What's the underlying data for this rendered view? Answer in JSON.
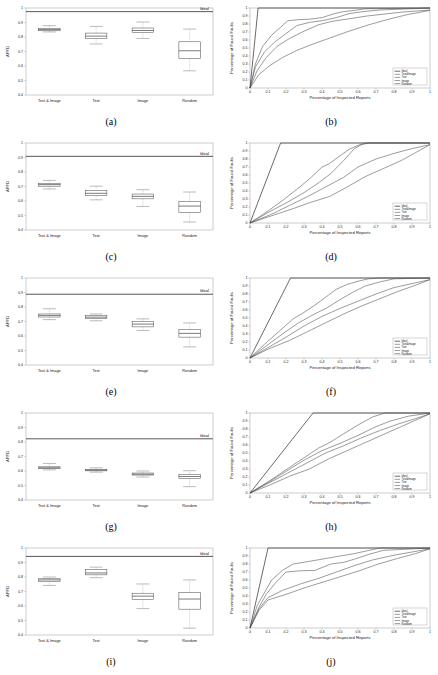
{
  "figure": {
    "panel_labels": [
      "(a)",
      "(b)",
      "(c)",
      "(d)",
      "(e)",
      "(f)",
      "(g)",
      "(h)",
      "(i)",
      "(j)"
    ]
  },
  "box_axis": {
    "ylabel": "APFD",
    "yticks": [
      "0.4",
      "0.5",
      "0.6",
      "0.7",
      "0.8",
      "0.9",
      "1"
    ],
    "categories": [
      "Text & Image",
      "Text",
      "Image",
      "Random"
    ],
    "ideal_label": "Ideal"
  },
  "curve_axis": {
    "xlabel": "Percentage of Inspected Reports",
    "ylabel": "Percentage of Found Faults",
    "xticks": [
      "0",
      "0.1",
      "0.2",
      "0.3",
      "0.4",
      "0.5",
      "0.6",
      "0.7",
      "0.8",
      "0.9",
      "1"
    ],
    "yticks": [
      "0",
      "0.1",
      "0.2",
      "0.3",
      "0.4",
      "0.5",
      "0.6",
      "0.7",
      "0.8",
      "0.9",
      "1"
    ],
    "legend": [
      "Ideal",
      "Text&Image",
      "Text",
      "Image",
      "Random"
    ]
  },
  "chart_data": [
    {
      "type": "box",
      "panel": "(a)",
      "title": "",
      "xlabel": "",
      "ylabel": "APFD",
      "ylim": [
        0.4,
        1.0
      ],
      "grid": false,
      "categories": [
        "Text & Image",
        "Text",
        "Image",
        "Random"
      ],
      "ideal_line": 0.975,
      "boxes": [
        {
          "name": "Text & Image",
          "whisker_low": 0.835,
          "q1": 0.843,
          "median": 0.851,
          "q3": 0.86,
          "whisker_high": 0.878
        },
        {
          "name": "Text",
          "whisker_low": 0.752,
          "q1": 0.789,
          "median": 0.806,
          "q3": 0.827,
          "whisker_high": 0.873
        },
        {
          "name": "Image",
          "whisker_low": 0.79,
          "q1": 0.83,
          "median": 0.845,
          "q3": 0.862,
          "whisker_high": 0.903
        },
        {
          "name": "Random",
          "whisker_low": 0.567,
          "q1": 0.652,
          "median": 0.705,
          "q3": 0.767,
          "whisker_high": 0.855
        }
      ]
    },
    {
      "type": "line",
      "panel": "(b)",
      "title": "",
      "xlabel": "Percentage of Inspected Reports",
      "ylabel": "Percentage of Found Faults",
      "xlim": [
        0,
        1
      ],
      "ylim": [
        0,
        1
      ],
      "grid": false,
      "legend_position": "lower-right",
      "series": [
        {
          "name": "Ideal",
          "x": [
            0,
            0.045,
            1
          ],
          "y": [
            0,
            1,
            1
          ]
        },
        {
          "name": "Text&Image",
          "x": [
            0,
            0.03,
            0.07,
            0.12,
            0.16,
            0.21,
            0.27,
            0.33,
            0.4,
            0.47,
            0.52,
            0.58,
            0.64,
            1.0
          ],
          "y": [
            0,
            0.3,
            0.52,
            0.66,
            0.74,
            0.84,
            0.855,
            0.86,
            0.88,
            0.93,
            0.955,
            0.97,
            0.99,
            1.0
          ]
        },
        {
          "name": "Text",
          "x": [
            0,
            0.03,
            0.08,
            0.14,
            0.2,
            0.26,
            0.33,
            0.41,
            0.48,
            0.55,
            0.63,
            0.72,
            1.0
          ],
          "y": [
            0,
            0.26,
            0.45,
            0.58,
            0.68,
            0.78,
            0.82,
            0.845,
            0.88,
            0.93,
            0.955,
            0.975,
            1.0
          ]
        },
        {
          "name": "Image",
          "x": [
            0,
            0.04,
            0.09,
            0.15,
            0.22,
            0.3,
            0.38,
            0.46,
            0.55,
            0.65,
            0.75,
            0.85,
            1.0
          ],
          "y": [
            0,
            0.22,
            0.38,
            0.52,
            0.62,
            0.71,
            0.79,
            0.835,
            0.865,
            0.9,
            0.925,
            0.95,
            0.975
          ]
        },
        {
          "name": "Random",
          "x": [
            0,
            0.05,
            0.11,
            0.18,
            0.26,
            0.35,
            0.45,
            0.55,
            0.66,
            0.77,
            0.88,
            1.0
          ],
          "y": [
            0,
            0.17,
            0.28,
            0.38,
            0.47,
            0.55,
            0.63,
            0.71,
            0.79,
            0.86,
            0.92,
            0.97
          ]
        }
      ]
    },
    {
      "type": "box",
      "panel": "(c)",
      "title": "",
      "xlabel": "",
      "ylabel": "APFD",
      "ylim": [
        0.4,
        1.0
      ],
      "grid": false,
      "categories": [
        "Text & Image",
        "Text",
        "Image",
        "Random"
      ],
      "ideal_line": 0.908,
      "boxes": [
        {
          "name": "Text & Image",
          "whisker_low": 0.683,
          "q1": 0.702,
          "median": 0.713,
          "q3": 0.722,
          "whisker_high": 0.742
        },
        {
          "name": "Text",
          "whisker_low": 0.608,
          "q1": 0.638,
          "median": 0.653,
          "q3": 0.672,
          "whisker_high": 0.702
        },
        {
          "name": "Image",
          "whisker_low": 0.562,
          "q1": 0.615,
          "median": 0.632,
          "q3": 0.648,
          "whisker_high": 0.678
        },
        {
          "name": "Random",
          "whisker_low": 0.455,
          "q1": 0.522,
          "median": 0.565,
          "q3": 0.598,
          "whisker_high": 0.662
        }
      ]
    },
    {
      "type": "line",
      "panel": "(d)",
      "title": "",
      "xlabel": "Percentage of Inspected Reports",
      "ylabel": "Percentage of Found Faults",
      "xlim": [
        0,
        1
      ],
      "ylim": [
        0,
        1
      ],
      "grid": false,
      "legend_position": "lower-right",
      "series": [
        {
          "name": "Ideal",
          "x": [
            0,
            0.17,
            1
          ],
          "y": [
            0,
            1,
            1
          ]
        },
        {
          "name": "Text&Image",
          "x": [
            0,
            0.1,
            0.18,
            0.26,
            0.33,
            0.4,
            0.44,
            0.5,
            0.55,
            0.6,
            0.64,
            1.0
          ],
          "y": [
            0,
            0.15,
            0.28,
            0.42,
            0.55,
            0.7,
            0.74,
            0.84,
            0.92,
            0.97,
            1.0,
            1.0
          ]
        },
        {
          "name": "Text",
          "x": [
            0,
            0.1,
            0.2,
            0.3,
            0.38,
            0.45,
            0.52,
            0.58,
            0.62,
            0.66,
            1.0
          ],
          "y": [
            0,
            0.13,
            0.25,
            0.38,
            0.5,
            0.62,
            0.78,
            0.93,
            0.98,
            1.0,
            1.0
          ]
        },
        {
          "name": "Image",
          "x": [
            0,
            0.12,
            0.22,
            0.32,
            0.42,
            0.52,
            0.6,
            0.7,
            0.8,
            0.9,
            1.0
          ],
          "y": [
            0,
            0.11,
            0.22,
            0.33,
            0.45,
            0.57,
            0.7,
            0.8,
            0.87,
            0.93,
            0.98
          ]
        },
        {
          "name": "Random",
          "x": [
            0,
            0.12,
            0.24,
            0.34,
            0.44,
            0.54,
            0.64,
            0.74,
            0.84,
            0.92,
            1.0
          ],
          "y": [
            0,
            0.09,
            0.18,
            0.26,
            0.33,
            0.45,
            0.58,
            0.68,
            0.78,
            0.88,
            0.98
          ]
        }
      ]
    },
    {
      "type": "box",
      "panel": "(e)",
      "title": "",
      "xlabel": "",
      "ylabel": "APFD",
      "ylim": [
        0.4,
        1.0
      ],
      "grid": false,
      "categories": [
        "Text & Image",
        "Text",
        "Image",
        "Random"
      ],
      "ideal_line": 0.888,
      "boxes": [
        {
          "name": "Text & Image",
          "whisker_low": 0.713,
          "q1": 0.731,
          "median": 0.742,
          "q3": 0.752,
          "whisker_high": 0.788
        },
        {
          "name": "Text",
          "whisker_low": 0.705,
          "q1": 0.722,
          "median": 0.73,
          "q3": 0.74,
          "whisker_high": 0.752
        },
        {
          "name": "Image",
          "whisker_low": 0.638,
          "q1": 0.663,
          "median": 0.682,
          "q3": 0.7,
          "whisker_high": 0.718
        },
        {
          "name": "Random",
          "whisker_low": 0.525,
          "q1": 0.592,
          "median": 0.618,
          "q3": 0.645,
          "whisker_high": 0.69
        }
      ]
    },
    {
      "type": "line",
      "panel": "(f)",
      "title": "",
      "xlabel": "Percentage of Inspected Reports",
      "ylabel": "Percentage of Found Faults",
      "xlim": [
        0,
        1
      ],
      "ylim": [
        0,
        1
      ],
      "grid": false,
      "legend_position": "lower-right",
      "series": [
        {
          "name": "Ideal",
          "x": [
            0,
            0.225,
            1
          ],
          "y": [
            0,
            1,
            1
          ]
        },
        {
          "name": "Text&Image",
          "x": [
            0,
            0.08,
            0.16,
            0.24,
            0.3,
            0.36,
            0.42,
            0.48,
            0.54,
            0.6,
            0.66,
            0.72,
            1.0
          ],
          "y": [
            0,
            0.17,
            0.33,
            0.49,
            0.57,
            0.66,
            0.76,
            0.86,
            0.92,
            0.96,
            0.99,
            1.0,
            1.0
          ]
        },
        {
          "name": "Text",
          "x": [
            0,
            0.09,
            0.18,
            0.27,
            0.35,
            0.43,
            0.5,
            0.57,
            0.64,
            0.72,
            0.8,
            1.0
          ],
          "y": [
            0,
            0.15,
            0.3,
            0.44,
            0.54,
            0.63,
            0.73,
            0.82,
            0.9,
            0.95,
            0.99,
            1.0
          ]
        },
        {
          "name": "Image",
          "x": [
            0,
            0.1,
            0.2,
            0.3,
            0.4,
            0.5,
            0.6,
            0.7,
            0.8,
            0.9,
            1.0
          ],
          "y": [
            0,
            0.13,
            0.26,
            0.4,
            0.52,
            0.62,
            0.71,
            0.8,
            0.88,
            0.93,
            0.98
          ]
        },
        {
          "name": "Random",
          "x": [
            0,
            0.1,
            0.22,
            0.32,
            0.42,
            0.52,
            0.62,
            0.72,
            0.82,
            0.92,
            1.0
          ],
          "y": [
            0,
            0.11,
            0.22,
            0.33,
            0.44,
            0.55,
            0.65,
            0.74,
            0.83,
            0.91,
            0.98
          ]
        }
      ]
    },
    {
      "type": "box",
      "panel": "(g)",
      "title": "",
      "xlabel": "",
      "ylabel": "APFD",
      "ylim": [
        0.4,
        1.0
      ],
      "grid": false,
      "categories": [
        "Text & Image",
        "Text",
        "Image",
        "Random"
      ],
      "ideal_line": 0.822,
      "boxes": [
        {
          "name": "Text & Image",
          "whisker_low": 0.608,
          "q1": 0.616,
          "median": 0.622,
          "q3": 0.629,
          "whisker_high": 0.652
        },
        {
          "name": "Text",
          "whisker_low": 0.592,
          "q1": 0.601,
          "median": 0.606,
          "q3": 0.612,
          "whisker_high": 0.622
        },
        {
          "name": "Image",
          "whisker_low": 0.558,
          "q1": 0.572,
          "median": 0.578,
          "q3": 0.586,
          "whisker_high": 0.6
        },
        {
          "name": "Random",
          "whisker_low": 0.492,
          "q1": 0.548,
          "median": 0.562,
          "q3": 0.575,
          "whisker_high": 0.602
        }
      ]
    },
    {
      "type": "line",
      "panel": "(h)",
      "title": "",
      "xlabel": "Percentage of Inspected Reports",
      "ylabel": "Percentage of Found Faults",
      "xlim": [
        0,
        1
      ],
      "ylim": [
        0,
        1
      ],
      "grid": false,
      "legend_position": "lower-right",
      "series": [
        {
          "name": "Ideal",
          "x": [
            0,
            0.35,
            1
          ],
          "y": [
            0,
            1,
            1
          ]
        },
        {
          "name": "Text&Image",
          "x": [
            0,
            0.1,
            0.2,
            0.3,
            0.38,
            0.45,
            0.52,
            0.6,
            0.68,
            0.75,
            1.0
          ],
          "y": [
            0,
            0.14,
            0.29,
            0.44,
            0.56,
            0.64,
            0.74,
            0.85,
            0.95,
            1.0,
            1.0
          ]
        },
        {
          "name": "Text",
          "x": [
            0,
            0.1,
            0.2,
            0.3,
            0.4,
            0.5,
            0.6,
            0.7,
            0.78,
            0.88,
            1.0
          ],
          "y": [
            0,
            0.13,
            0.27,
            0.41,
            0.53,
            0.62,
            0.72,
            0.83,
            0.9,
            0.96,
            1.0
          ]
        },
        {
          "name": "Image",
          "x": [
            0,
            0.1,
            0.21,
            0.32,
            0.42,
            0.52,
            0.62,
            0.72,
            0.82,
            0.92,
            1.0
          ],
          "y": [
            0,
            0.12,
            0.25,
            0.38,
            0.5,
            0.59,
            0.69,
            0.78,
            0.86,
            0.93,
            0.99
          ]
        },
        {
          "name": "Random",
          "x": [
            0,
            0.11,
            0.22,
            0.33,
            0.44,
            0.54,
            0.64,
            0.74,
            0.84,
            0.93,
            1.0
          ],
          "y": [
            0,
            0.1,
            0.21,
            0.3,
            0.43,
            0.53,
            0.63,
            0.73,
            0.83,
            0.92,
            0.99
          ]
        }
      ]
    },
    {
      "type": "box",
      "panel": "(i)",
      "title": "",
      "xlabel": "",
      "ylabel": "APFD",
      "ylim": [
        0.4,
        1.0
      ],
      "grid": false,
      "categories": [
        "Text & Image",
        "Text",
        "Image",
        "Random"
      ],
      "ideal_line": 0.942,
      "boxes": [
        {
          "name": "Text & Image",
          "whisker_low": 0.742,
          "q1": 0.77,
          "median": 0.78,
          "q3": 0.788,
          "whisker_high": 0.8
        },
        {
          "name": "Text",
          "whisker_low": 0.795,
          "q1": 0.815,
          "median": 0.828,
          "q3": 0.852,
          "whisker_high": 0.868
        },
        {
          "name": "Image",
          "whisker_low": 0.582,
          "q1": 0.645,
          "median": 0.668,
          "q3": 0.688,
          "whisker_high": 0.752
        },
        {
          "name": "Random",
          "whisker_low": 0.447,
          "q1": 0.578,
          "median": 0.648,
          "q3": 0.692,
          "whisker_high": 0.78
        }
      ]
    },
    {
      "type": "line",
      "panel": "(j)",
      "title": "",
      "xlabel": "Percentage of Inspected Reports",
      "ylabel": "Percentage of Found Faults",
      "xlim": [
        0,
        1
      ],
      "ylim": [
        0,
        1
      ],
      "grid": false,
      "legend_position": "lower-right",
      "series": [
        {
          "name": "Ideal",
          "x": [
            0,
            0.1,
            1
          ],
          "y": [
            0,
            1,
            1
          ]
        },
        {
          "name": "Text&Image",
          "x": [
            0,
            0.04,
            0.08,
            0.12,
            0.18,
            0.24,
            0.32,
            0.4,
            0.5,
            0.58,
            0.66,
            0.72,
            1.0
          ],
          "y": [
            0,
            0.28,
            0.44,
            0.6,
            0.72,
            0.8,
            0.83,
            0.86,
            0.9,
            0.93,
            0.97,
            1.0,
            1.0
          ]
        },
        {
          "name": "Text",
          "x": [
            0,
            0.05,
            0.09,
            0.14,
            0.2,
            0.28,
            0.36,
            0.45,
            0.52,
            0.58,
            0.66,
            0.74,
            1.0
          ],
          "y": [
            0,
            0.26,
            0.42,
            0.56,
            0.7,
            0.715,
            0.72,
            0.8,
            0.82,
            0.86,
            0.92,
            0.97,
            1.0
          ]
        },
        {
          "name": "Image",
          "x": [
            0,
            0.05,
            0.1,
            0.18,
            0.28,
            0.38,
            0.48,
            0.58,
            0.68,
            0.8,
            0.9,
            1.0
          ],
          "y": [
            0,
            0.24,
            0.38,
            0.47,
            0.55,
            0.62,
            0.7,
            0.78,
            0.85,
            0.91,
            0.95,
            0.99
          ]
        },
        {
          "name": "Random",
          "x": [
            0,
            0.05,
            0.1,
            0.2,
            0.3,
            0.4,
            0.5,
            0.6,
            0.7,
            0.82,
            0.92,
            1.0
          ],
          "y": [
            0,
            0.22,
            0.35,
            0.42,
            0.5,
            0.57,
            0.64,
            0.71,
            0.79,
            0.87,
            0.93,
            0.99
          ]
        }
      ]
    }
  ]
}
